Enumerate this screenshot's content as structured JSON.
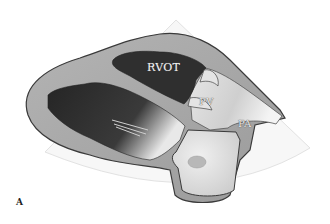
{
  "figure": {
    "panel_letter": "A",
    "labels": {
      "rvot": "RVOT",
      "pv": "PV",
      "pa": "PA"
    },
    "colors": {
      "background": "#ffffff",
      "sector_fill": "#f7f7f7",
      "sector_edge": "#e2e2e2",
      "myocardium": "#a9a9a9",
      "cavity_dark": "#2e2e2e",
      "vessel_light": "#dcdcdc",
      "outline": "#3a3a3a"
    }
  }
}
